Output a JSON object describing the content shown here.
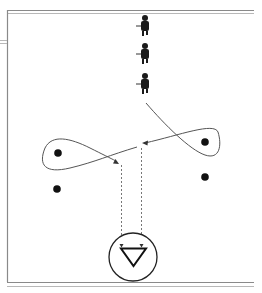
{
  "diagram": {
    "type": "hockey-drill",
    "colors": {
      "frame": "#8a8a8a",
      "path": "#555555",
      "dot": "#111111",
      "goal": "#222222",
      "background": "#ffffff"
    },
    "players": [
      {
        "id": "skater-1",
        "x": 145,
        "y": 22
      },
      {
        "id": "skater-2",
        "x": 145,
        "y": 50
      },
      {
        "id": "skater-3",
        "x": 145,
        "y": 80
      }
    ],
    "pucks_or_markers": [
      {
        "id": "marker-left-top",
        "x": 58,
        "y": 153
      },
      {
        "id": "marker-left-bottom",
        "x": 57,
        "y": 189
      },
      {
        "id": "marker-right-top",
        "x": 205,
        "y": 142
      },
      {
        "id": "marker-right-bottom",
        "x": 205,
        "y": 177
      }
    ],
    "goal": {
      "x": 133,
      "y": 257,
      "r": 24,
      "icon": "goalie-triangle"
    },
    "passes": [
      {
        "id": "pass-left",
        "x": 121,
        "from_y": 165,
        "to_y": 240
      },
      {
        "id": "pass-right",
        "x": 141,
        "from_y": 145,
        "to_y": 240
      }
    ]
  }
}
